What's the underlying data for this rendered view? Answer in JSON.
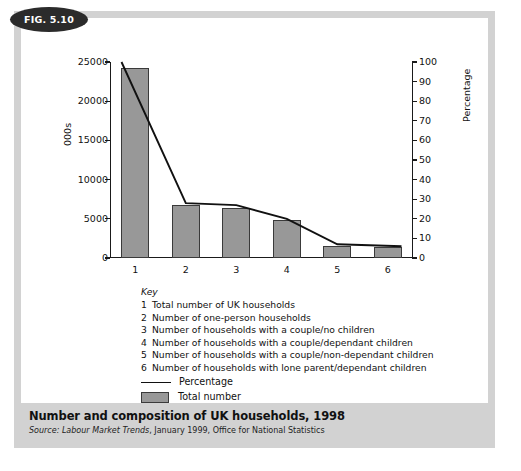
{
  "figure": {
    "badge": "FIG. 5.10",
    "caption_title": "Number and composition of UK households, 1998",
    "source_label": "Source:",
    "source_publication": "Labour Market Trends",
    "source_rest": ", January 1999, Office for National Statistics"
  },
  "key": {
    "title": "Key",
    "items": [
      {
        "num": "1",
        "text": "Total number of UK households"
      },
      {
        "num": "2",
        "text": "Number of one-person households"
      },
      {
        "num": "3",
        "text": "Number of households with a couple/no children"
      },
      {
        "num": "4",
        "text": "Number of households with a couple/dependant children"
      },
      {
        "num": "5",
        "text": "Number of households with a couple/non-dependant children"
      },
      {
        "num": "6",
        "text": "Number of households with lone parent/dependant children"
      }
    ],
    "legend": [
      {
        "type": "line",
        "label": "Percentage"
      },
      {
        "type": "box",
        "label": "Total number"
      }
    ]
  },
  "chart_data": {
    "type": "bar",
    "title": "Number and composition of UK households, 1998",
    "xlabel": "",
    "ylabel": "000s",
    "y2label": "Percentage",
    "categories": [
      "1",
      "2",
      "3",
      "4",
      "5",
      "6"
    ],
    "series": [
      {
        "name": "Total number",
        "type": "bar",
        "axis": "left",
        "values": [
          24200,
          6700,
          6400,
          4850,
          1550,
          1350
        ]
      },
      {
        "name": "Percentage",
        "type": "line",
        "axis": "right",
        "values": [
          100,
          28,
          27,
          20,
          7,
          6
        ]
      }
    ],
    "ylim": [
      0,
      25000
    ],
    "yticks": [
      0,
      5000,
      10000,
      15000,
      20000,
      25000
    ],
    "ytick_labels": [
      "0",
      "5000",
      "10000",
      "15000",
      "20000",
      "25000"
    ],
    "y2lim": [
      0,
      100
    ],
    "y2ticks": [
      0,
      10,
      20,
      30,
      40,
      50,
      60,
      70,
      80,
      90,
      100
    ],
    "y2tick_labels": [
      "0",
      "10",
      "20",
      "30",
      "40",
      "50",
      "60",
      "70",
      "80",
      "90",
      "100"
    ],
    "grid": false,
    "legend_position": "below-plot",
    "colors": {
      "bar_fill": "#989898",
      "bar_stroke": "#3a3a3a",
      "line": "#111111",
      "frame": "#d2d2d2",
      "badge": "#2b2b2b"
    }
  }
}
